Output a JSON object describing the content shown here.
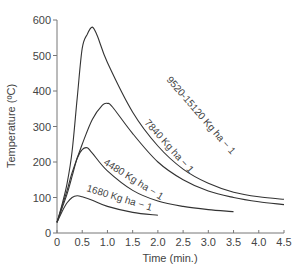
{
  "chart_data": {
    "type": "line",
    "title": "",
    "xlabel": "Time (min.)",
    "ylabel": "Temperature (ºC)",
    "xlim": [
      0,
      4.5
    ],
    "ylim": [
      0,
      600
    ],
    "x_ticks": [
      "0",
      "0.5",
      "1.0",
      "1.5",
      "2.0",
      "2.5",
      "3.0",
      "3.5",
      "4.0",
      "4.5"
    ],
    "y_ticks": [
      "0",
      "100",
      "200",
      "300",
      "400",
      "500",
      "600"
    ],
    "grid": false,
    "legend": "inline curve labels",
    "series": [
      {
        "name": "9520-15120 Kg ha − 1",
        "x": [
          0,
          0.1,
          0.2,
          0.3,
          0.4,
          0.5,
          0.6,
          0.7,
          0.8,
          1.0,
          1.5,
          2.0,
          2.5,
          3.0,
          3.5,
          4.0,
          4.5
        ],
        "y": [
          30,
          80,
          140,
          230,
          380,
          520,
          560,
          580,
          555,
          480,
          340,
          245,
          180,
          140,
          115,
          102,
          95
        ]
      },
      {
        "name": "7840 Kg ha − 1",
        "x": [
          0,
          0.1,
          0.2,
          0.3,
          0.5,
          0.7,
          0.9,
          1.0,
          1.1,
          1.5,
          2.0,
          2.5,
          3.0,
          3.5,
          4.0,
          4.5
        ],
        "y": [
          30,
          75,
          120,
          170,
          250,
          320,
          360,
          365,
          355,
          280,
          200,
          150,
          118,
          100,
          88,
          80
        ]
      },
      {
        "name": "4480 Kg ha − 1",
        "x": [
          0,
          0.1,
          0.2,
          0.3,
          0.4,
          0.5,
          0.6,
          0.7,
          1.0,
          1.5,
          2.0,
          2.5,
          3.0,
          3.5
        ],
        "y": [
          30,
          70,
          110,
          160,
          210,
          235,
          240,
          225,
          175,
          120,
          90,
          75,
          66,
          60
        ]
      },
      {
        "name": "1680 Kg ha − 1",
        "x": [
          0,
          0.1,
          0.2,
          0.3,
          0.4,
          0.5,
          0.7,
          1.0,
          1.5,
          2.0
        ],
        "y": [
          30,
          60,
          85,
          100,
          105,
          102,
          92,
          75,
          58,
          50
        ]
      }
    ]
  },
  "labels": {
    "curve1": "9520-15120 Kg ha − 1",
    "curve2": "7840 Kg ha − 1",
    "curve3": "4480 Kg ha − 1",
    "curve4": "1680 Kg ha − 1"
  }
}
